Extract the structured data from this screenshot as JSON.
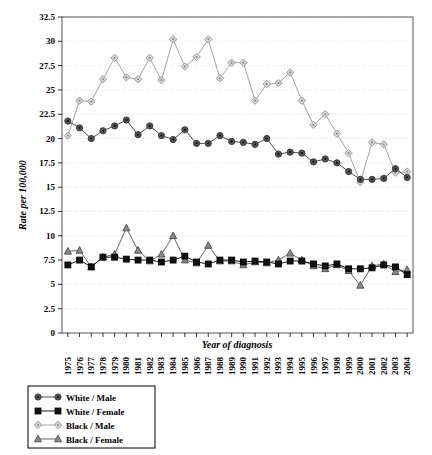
{
  "chart_data": {
    "type": "line",
    "title": "",
    "xlabel": "Year of diagnosis",
    "ylabel": "Rate per 100,000",
    "ylim": [
      0,
      32.5
    ],
    "ytick_step": 2.5,
    "yticks": [
      "0",
      "2.5",
      "5",
      "7.5",
      "10",
      "12.5",
      "15",
      "17.5",
      "20",
      "22.5",
      "25",
      "27.5",
      "30",
      "32.5"
    ],
    "grid": true,
    "legend_position": "bottom-left",
    "categories": [
      "1975",
      "1976",
      "1977",
      "1978",
      "1979",
      "1980",
      "1981",
      "1982",
      "1983",
      "1984",
      "1985",
      "1986",
      "1987",
      "1988",
      "1989",
      "1990",
      "1991",
      "1992",
      "1993",
      "1994",
      "1995",
      "1996",
      "1997",
      "1998",
      "1999",
      "2000",
      "2001",
      "2002",
      "2003",
      "2004"
    ],
    "series": [
      {
        "name": "White / Male",
        "marker": "circle",
        "color": "#3a3a3a",
        "fill": "#555555",
        "values": [
          21.8,
          21.1,
          20.0,
          20.8,
          21.3,
          21.9,
          20.4,
          21.3,
          20.3,
          19.9,
          20.9,
          19.5,
          19.5,
          20.3,
          19.7,
          19.6,
          19.4,
          20.0,
          18.4,
          18.6,
          18.5,
          17.6,
          17.9,
          17.5,
          16.6,
          15.8,
          15.8,
          15.9,
          16.9,
          16.0
        ]
      },
      {
        "name": "White / Female",
        "marker": "square",
        "color": "#000000",
        "fill": "#111111",
        "values": [
          7.0,
          7.5,
          6.8,
          7.8,
          7.8,
          7.6,
          7.5,
          7.5,
          7.3,
          7.5,
          7.9,
          7.3,
          7.1,
          7.5,
          7.5,
          7.3,
          7.4,
          7.3,
          7.1,
          7.4,
          7.4,
          7.1,
          6.9,
          7.1,
          6.6,
          6.6,
          6.7,
          7.0,
          6.8,
          6.0
        ]
      },
      {
        "name": "Black / Male",
        "marker": "diamond",
        "color": "#9a9a9a",
        "fill": "#d9d9d9",
        "values": [
          20.3,
          23.9,
          23.8,
          26.1,
          28.3,
          26.3,
          26.1,
          28.3,
          26.0,
          30.2,
          27.4,
          28.4,
          30.2,
          26.2,
          27.8,
          27.8,
          23.9,
          25.6,
          25.7,
          26.8,
          23.9,
          21.4,
          22.5,
          20.5,
          18.5,
          15.5,
          19.6,
          19.4,
          16.5,
          16.6
        ]
      },
      {
        "name": "Black / Female",
        "marker": "triangle",
        "color": "#555555",
        "fill": "#8a8a8a",
        "values": [
          8.4,
          8.5,
          6.8,
          7.8,
          8.1,
          10.8,
          8.5,
          7.4,
          8.1,
          10.0,
          7.5,
          7.2,
          9.0,
          7.4,
          7.4,
          7.0,
          7.3,
          7.2,
          7.5,
          8.2,
          7.5,
          6.9,
          6.6,
          7.0,
          6.4,
          4.9,
          6.9,
          7.1,
          6.3,
          6.5
        ]
      }
    ]
  },
  "legend": {
    "items": [
      {
        "label": "White / Male"
      },
      {
        "label": "White / Female"
      },
      {
        "label": "Black / Male"
      },
      {
        "label": "Black / Female"
      }
    ]
  }
}
